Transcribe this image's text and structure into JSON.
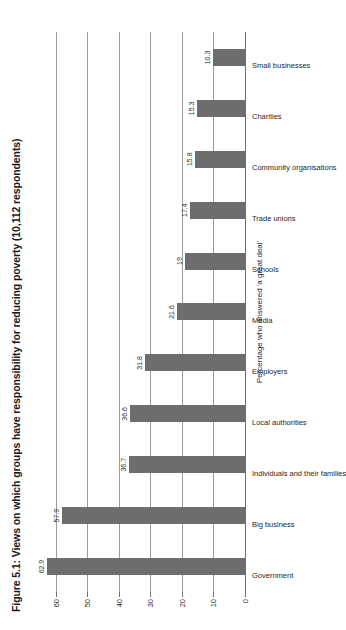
{
  "figure": {
    "title": "Figure 5.1: Views on which groups have responsibility for reducing poverty (10,112 respondents)",
    "background_color": "#ffffff",
    "bar_color": "#6d6d6d",
    "gridline_color": "#9a9a9a"
  },
  "chart_data": {
    "type": "bar",
    "title": "Figure 5.1: Views on which groups have responsibility for reducing poverty (10,112 respondents)",
    "xlabel": "",
    "ylabel": "Percentage who answered 'a great deal'",
    "categories": [
      "Government",
      "Big business",
      "Individuals and their families",
      "Local authorities",
      "Employers",
      "Media",
      "Schools",
      "Trade unions",
      "Community organisations",
      "Charities",
      "Small businesses"
    ],
    "values": [
      62.9,
      57.9,
      36.7,
      36.6,
      31.8,
      21.6,
      19,
      17.4,
      15.8,
      15.3,
      10.3
    ],
    "value_labels": [
      "62.9",
      "57.9",
      "36.7",
      "36.6",
      "31.8",
      "21.6",
      "19",
      "17.4",
      "15.8",
      "15.3",
      "10.3"
    ],
    "ylim": [
      0,
      65
    ],
    "yticks": [
      0,
      10,
      20,
      30,
      40,
      50,
      60
    ],
    "ytick_labels": [
      "0",
      "10",
      "20",
      "30",
      "40",
      "50",
      "60"
    ],
    "grid": true,
    "grid_axis": "y",
    "legend": false,
    "orientation": "vertical",
    "rotated_page": true,
    "respondents": "10,112"
  }
}
